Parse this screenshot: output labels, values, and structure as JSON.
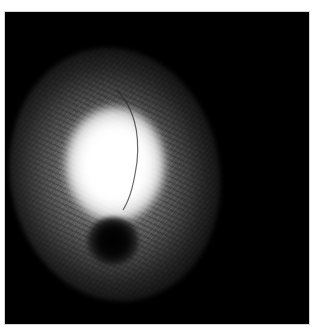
{
  "image": {
    "description": "Grayscale fluorescence-style image: bright diffuse glow with a dark circular spot below center and a thin curved vessel line",
    "background_color": "#000000",
    "border_color": "#ffffff",
    "glow_color": "#ffffff",
    "spot_color": "#000000"
  }
}
